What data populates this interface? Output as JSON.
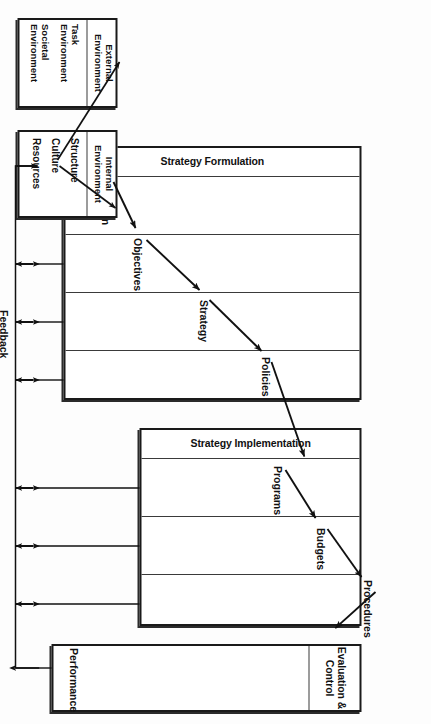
{
  "figure": {
    "type": "diagram",
    "subtype": "flow-diagram",
    "orientation_note": "rotated-90-ccw"
  },
  "phases": [
    {
      "id": "strategy-formulation",
      "title": "Strategy Formulation",
      "steps": [
        "Mission",
        "Objectives",
        "Strategy",
        "Policies"
      ]
    },
    {
      "id": "strategy-implementation",
      "title": "Strategy Implementation",
      "steps": [
        "Programs",
        "Budgets",
        "Procedures"
      ]
    },
    {
      "id": "evaluation-control",
      "title": "Evaluation\n& Control",
      "steps": [
        "Performance"
      ]
    }
  ],
  "inputs": [
    {
      "id": "external-environment",
      "title": "External\nEnvironment",
      "items": [
        "Task\nEnvironment",
        "Societal\nEnvironment"
      ]
    },
    {
      "id": "internal-environment",
      "title": "Internal\nEnvironment",
      "items": [
        "Structure",
        "Culture",
        "Resources"
      ]
    }
  ],
  "feedback": {
    "label": "Feedback"
  },
  "colors": {
    "line": "#1a1a1a",
    "divider": "#3a3a3a",
    "background": "#ffffff",
    "text": "#111111"
  }
}
